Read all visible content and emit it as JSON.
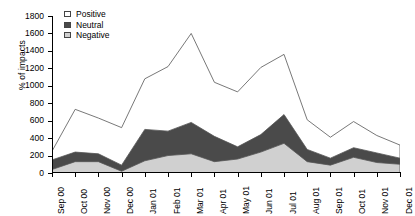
{
  "chart_data": {
    "type": "area",
    "stacked": true,
    "title": "",
    "xlabel": "",
    "ylabel": "% of impacts",
    "ylim": [
      0,
      1800
    ],
    "ytick_step": 200,
    "yticks": [
      1800,
      1600,
      1400,
      1200,
      1000,
      800,
      600,
      400,
      200,
      0
    ],
    "grid": false,
    "legend_position": "top-left",
    "categories": [
      "Sep 00",
      "Oct 00",
      "Nov 00",
      "Dec 00",
      "Jan 01",
      "Feb 01",
      "Mar 01",
      "Apr 01",
      "May 01",
      "Jun 01",
      "Jul 01",
      "Aug 01",
      "Sep 01",
      "Oct 01",
      "Nov 01",
      "Dec 01"
    ],
    "series": [
      {
        "name": "Negative",
        "color": "#d0d0d0",
        "values": [
          40,
          130,
          130,
          20,
          140,
          200,
          220,
          130,
          160,
          240,
          340,
          130,
          90,
          180,
          120,
          100
        ]
      },
      {
        "name": "Neutral",
        "color": "#4a4a4a",
        "values": [
          110,
          110,
          90,
          70,
          360,
          280,
          360,
          290,
          140,
          200,
          330,
          140,
          80,
          110,
          110,
          70
        ]
      },
      {
        "name": "Positive",
        "color": "#ffffff",
        "values": [
          100,
          490,
          410,
          430,
          580,
          740,
          1020,
          620,
          630,
          770,
          690,
          340,
          240,
          300,
          200,
          150
        ]
      }
    ],
    "legend": [
      {
        "label": "Positive",
        "swatch": "#ffffff"
      },
      {
        "label": "Neutral",
        "swatch": "#4a4a4a"
      },
      {
        "label": "Negative",
        "swatch": "#d0d0d0"
      }
    ]
  }
}
